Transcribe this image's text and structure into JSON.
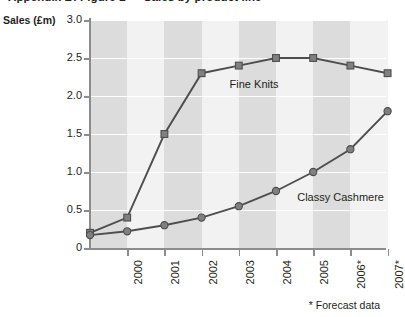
{
  "chart_title": "Appendix B: Figure 2 — Sales by product line",
  "y_axis_title": "Sales (£m)",
  "footnote": "* Forecast data",
  "series_labels": {
    "fine_knits": "Fine Knits",
    "classy_cashmere": "Classy Cashmere"
  },
  "colors": {
    "line": "#4d4d4d",
    "marker": "#808080",
    "band_dark": "#dcdcdc",
    "band_light": "#f2f2f2",
    "gridline": "#ffffff",
    "axis": "#8c8c8c",
    "text": "#231f20"
  },
  "chart_data": {
    "type": "line",
    "title": "Appendix B: Figure 2 — Sales by product line",
    "xlabel": "",
    "ylabel": "Sales (£m)",
    "ylim": [
      0,
      3.0
    ],
    "yticks": [
      0,
      0.5,
      1.0,
      1.5,
      2.0,
      2.5,
      3.0
    ],
    "ytick_labels": [
      "0",
      "0.5",
      "1.0",
      "1.5",
      "2.0",
      "2.5",
      "3.0"
    ],
    "categories": [
      "",
      "2000",
      "2001",
      "2002",
      "2003",
      "2004",
      "2005",
      "2006*",
      "2007*"
    ],
    "xtick_labels": [
      "2000",
      "2001",
      "2002",
      "2003",
      "2004",
      "2005",
      "2006*",
      "2007*"
    ],
    "grid": "horizontal",
    "legend_position": "inline-annotation",
    "annotations": [
      {
        "text": "Fine Knits",
        "series": "Fine Knits"
      },
      {
        "text": "Classy Cashmere",
        "series": "Classy Cashmere"
      },
      {
        "text": "* Forecast data",
        "note": "footnote bottom-right"
      }
    ],
    "series": [
      {
        "name": "Fine Knits",
        "marker": "square",
        "values": [
          0.2,
          0.4,
          1.5,
          2.3,
          2.4,
          2.5,
          2.5,
          2.4,
          2.3
        ]
      },
      {
        "name": "Classy Cashmere",
        "marker": "circle",
        "values": [
          0.17,
          0.22,
          0.3,
          0.4,
          0.55,
          0.75,
          1.0,
          1.3,
          1.8
        ]
      }
    ]
  }
}
